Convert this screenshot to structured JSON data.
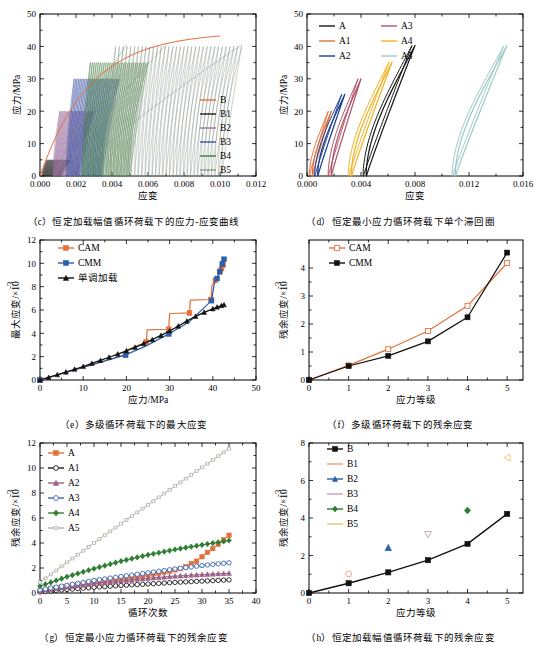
{
  "figure": {
    "panels": [
      "c",
      "d",
      "e",
      "f",
      "g",
      "h"
    ]
  },
  "panel_c": {
    "caption": "（c）恒定加载幅值循环荷载下的应力-应变曲线",
    "chart_data": {
      "type": "line",
      "title": "",
      "xlabel": "应变",
      "ylabel": "应力/MPa",
      "xlim": [
        0,
        0.012
      ],
      "ylim": [
        0,
        50
      ],
      "xticks": [
        "0.000",
        "0.002",
        "0.004",
        "0.006",
        "0.008",
        "0.010",
        "0.012"
      ],
      "yticks": [
        "0",
        "10",
        "20",
        "30",
        "40",
        "50"
      ],
      "grid": false,
      "legend_position": "right-middle",
      "series": [
        {
          "name": "B",
          "color": "#e2713c",
          "peak_stress": 43.2,
          "peak_strain": 0.01,
          "note": "单调包络线"
        },
        {
          "name": "B1",
          "color": "#1a1a1a",
          "cycle_stress": 5,
          "strain_range": [
            0.0004,
            0.0018
          ]
        },
        {
          "name": "B2",
          "color": "#9b6fa0",
          "cycle_stress": 20,
          "strain_range": [
            0.0011,
            0.003
          ]
        },
        {
          "name": "B3",
          "color": "#3a52a4",
          "cycle_stress": 30,
          "strain_range": [
            0.0019,
            0.0044
          ]
        },
        {
          "name": "B4",
          "color": "#3f7a3a",
          "cycle_stress": 35,
          "strain_range": [
            0.0028,
            0.006
          ]
        },
        {
          "name": "B5",
          "color": "#8a9a8c",
          "cycle_stress": 40,
          "strain_range": [
            0.0042,
            0.0112
          ]
        }
      ]
    }
  },
  "panel_d": {
    "caption": "（d）恒定最小应力循环荷载下单个滞回圈",
    "chart_data": {
      "type": "line",
      "title": "",
      "xlabel": "应变",
      "ylabel": "应力/MPa",
      "xlim": [
        0,
        0.016
      ],
      "ylim": [
        0,
        50
      ],
      "xticks": [
        "0.000",
        "0.004",
        "0.008",
        "0.012",
        "0.016"
      ],
      "yticks": [
        "0",
        "10",
        "20",
        "30",
        "40",
        "50"
      ],
      "grid": false,
      "legend_position": "top-left",
      "series": [
        {
          "name": "A",
          "color": "#1a1a1a",
          "loop_top_stress": 40.3,
          "loop_top_strain": 0.008,
          "loop_base_strain": 0.0044
        },
        {
          "name": "A1",
          "color": "#e2713c",
          "loop_top_stress": 20.0,
          "loop_top_strain": 0.0018,
          "loop_base_strain": 0.0004
        },
        {
          "name": "A2",
          "color": "#1b3f94",
          "loop_top_stress": 25.2,
          "loop_top_strain": 0.0028,
          "loop_base_strain": 0.0008
        },
        {
          "name": "A3",
          "color": "#b0566a",
          "loop_top_stress": 30.0,
          "loop_top_strain": 0.004,
          "loop_base_strain": 0.0018
        },
        {
          "name": "A4",
          "color": "#f0b323",
          "loop_top_stress": 35.2,
          "loop_top_strain": 0.0063,
          "loop_base_strain": 0.0033
        },
        {
          "name": "A5",
          "color": "#9fcbc6",
          "loop_top_stress": 40.2,
          "loop_top_strain": 0.0148,
          "loop_base_strain": 0.011
        }
      ]
    }
  },
  "panel_e": {
    "caption": "（e）多级循环荷载下的最大应变",
    "chart_data": {
      "type": "line",
      "title": "",
      "xlabel": "应力/MPa",
      "ylabel": "最大应变/×10⁻³",
      "xlim": [
        0,
        50
      ],
      "ylim": [
        0,
        12
      ],
      "xticks": [
        "0",
        "10",
        "20",
        "30",
        "40",
        "50"
      ],
      "yticks": [
        "0",
        "2",
        "4",
        "6",
        "8",
        "10",
        "12"
      ],
      "grid": false,
      "legend_position": "top-left",
      "series": [
        {
          "name": "CAM",
          "color": "#e2713c",
          "marker": "square-filled",
          "x": [
            0,
            19.8,
            20.0,
            24.6,
            24.8,
            29.8,
            30.0,
            34.6,
            34.8,
            39.6,
            39.8,
            40.6,
            41.0,
            41.6,
            42.0,
            42.4
          ],
          "y": [
            0,
            2.15,
            2.55,
            3.25,
            4.3,
            4.35,
            5.7,
            5.75,
            6.85,
            6.9,
            8.1,
            8.55,
            8.6,
            9.25,
            9.55,
            9.85
          ]
        },
        {
          "name": "CMM",
          "color": "#2b5fa8",
          "marker": "square-filled",
          "x": [
            0,
            19.8,
            24.7,
            29.8,
            34.6,
            39.7,
            40.4,
            41.0,
            41.6,
            42.2,
            42.6
          ],
          "y": [
            0,
            2.15,
            2.95,
            3.95,
            5.0,
            6.8,
            8.35,
            8.7,
            9.3,
            9.95,
            10.35
          ]
        },
        {
          "name": "单调加载",
          "color": "#111111",
          "marker": "triangle-filled",
          "x": [
            0,
            2,
            4,
            6,
            8,
            10,
            12,
            14,
            16,
            18,
            20,
            22,
            24,
            26,
            28,
            30,
            32,
            34,
            36,
            38,
            40,
            41,
            42,
            42.6
          ],
          "y": [
            0,
            0.22,
            0.45,
            0.68,
            0.92,
            1.16,
            1.42,
            1.68,
            1.95,
            2.22,
            2.5,
            2.8,
            3.12,
            3.46,
            3.82,
            4.2,
            4.62,
            5.05,
            5.45,
            5.8,
            6.1,
            6.25,
            6.38,
            6.45
          ]
        }
      ]
    }
  },
  "panel_f": {
    "caption": "（f）多级循环荷载下的残余应变",
    "chart_data": {
      "type": "line",
      "title": "",
      "xlabel": "应力等级",
      "ylabel": "残余应变/×10⁻³",
      "xlim": [
        0,
        5.4
      ],
      "ylim": [
        0,
        5
      ],
      "xticks": [
        "0",
        "1",
        "2",
        "3",
        "4",
        "5"
      ],
      "yticks": [
        "0",
        "1",
        "2",
        "3",
        "4"
      ],
      "grid": false,
      "legend_position": "top-left",
      "categories": [
        0,
        1,
        2,
        3,
        4,
        5
      ],
      "series": [
        {
          "name": "CAM",
          "color": "#e2713c",
          "marker": "square-open",
          "values": [
            0,
            0.52,
            1.1,
            1.75,
            2.65,
            4.18
          ]
        },
        {
          "name": "CMM",
          "color": "#111111",
          "marker": "square-filled",
          "values": [
            0,
            0.5,
            0.86,
            1.38,
            2.24,
            4.55
          ]
        }
      ]
    }
  },
  "panel_g": {
    "caption": "（g）恒定最小应力循环荷载下的残余应变",
    "chart_data": {
      "type": "line",
      "title": "",
      "xlabel": "循环次数",
      "ylabel": "残余应变/×10⁻³",
      "xlim": [
        0,
        40
      ],
      "ylim": [
        0,
        12
      ],
      "xticks": [
        "0",
        "5",
        "10",
        "15",
        "20",
        "25",
        "30",
        "35",
        "40"
      ],
      "yticks": [
        "0",
        "2",
        "4",
        "6",
        "8",
        "10",
        "12"
      ],
      "grid": false,
      "legend_position": "top-left",
      "series": [
        {
          "name": "A",
          "color": "#e2713c",
          "marker": "square-filled",
          "end_cycle": 35,
          "end_value": 4.62,
          "x": [
            0,
            2,
            5,
            8,
            11,
            14,
            17,
            20,
            22,
            24,
            26,
            27,
            28,
            29,
            30,
            31,
            32,
            33,
            34,
            35
          ],
          "y": [
            0.15,
            0.35,
            0.55,
            0.75,
            0.95,
            1.1,
            1.25,
            1.45,
            1.6,
            1.75,
            1.95,
            2.1,
            2.35,
            2.55,
            2.9,
            3.25,
            3.55,
            3.9,
            4.25,
            4.62
          ]
        },
        {
          "name": "A1",
          "color": "#1a1a1a",
          "marker": "circle-open",
          "end_cycle": 35,
          "end_value": 1.05,
          "x": [
            0,
            5,
            10,
            15,
            20,
            25,
            30,
            35
          ],
          "y": [
            0.08,
            0.28,
            0.45,
            0.6,
            0.72,
            0.85,
            0.95,
            1.05
          ]
        },
        {
          "name": "A2",
          "color": "#9b5f86",
          "marker": "triangle-filled",
          "end_cycle": 35,
          "end_value": 1.58,
          "x": [
            0,
            5,
            10,
            15,
            20,
            25,
            30,
            35
          ],
          "y": [
            0.18,
            0.48,
            0.75,
            0.98,
            1.18,
            1.35,
            1.48,
            1.58
          ]
        },
        {
          "name": "A3",
          "color": "#3a66b5",
          "marker": "circle-open",
          "end_cycle": 35,
          "end_value": 2.42,
          "x": [
            0,
            5,
            10,
            15,
            20,
            25,
            30,
            35
          ],
          "y": [
            0.25,
            0.62,
            1.0,
            1.32,
            1.62,
            1.92,
            2.2,
            2.42
          ]
        },
        {
          "name": "A4",
          "color": "#2e7d32",
          "marker": "diamond-filled",
          "end_cycle": 35,
          "end_value": 4.2,
          "x": [
            0,
            5,
            10,
            15,
            20,
            25,
            30,
            35
          ],
          "y": [
            0.55,
            1.3,
            1.95,
            2.55,
            3.05,
            3.48,
            3.85,
            4.2
          ]
        },
        {
          "name": "A5",
          "color": "#b9b3ae",
          "marker": "bar-open",
          "end_cycle": 35,
          "end_value": 11.55,
          "x": [
            0,
            5,
            10,
            15,
            20,
            25,
            30,
            35
          ],
          "y": [
            0.85,
            2.45,
            4.0,
            5.55,
            7.05,
            8.55,
            10.05,
            11.55
          ]
        }
      ]
    }
  },
  "panel_h": {
    "caption": "（h）恒定加载幅值循环荷载下的残余应变",
    "chart_data": {
      "type": "scatter",
      "title": "",
      "xlabel": "应力等级",
      "ylabel": "残余应变/×10⁻³",
      "xlim": [
        0,
        5.4
      ],
      "ylim": [
        0,
        8
      ],
      "xticks": [
        "0",
        "1",
        "2",
        "3",
        "4",
        "5"
      ],
      "yticks": [
        "0",
        "2",
        "4",
        "6",
        "8"
      ],
      "grid": false,
      "legend_position": "top-left",
      "series": [
        {
          "name": "B",
          "color": "#111111",
          "marker": "square-filled",
          "type": "line",
          "x": [
            0,
            1,
            2,
            3,
            4,
            5
          ],
          "y": [
            0,
            0.52,
            1.1,
            1.75,
            2.62,
            4.22
          ]
        },
        {
          "name": "B1",
          "color": "#e8a07a",
          "marker": "circle-open",
          "type": "point",
          "x": [
            1
          ],
          "y": [
            1.02
          ]
        },
        {
          "name": "B2",
          "color": "#2b5fa8",
          "marker": "triangle-filled",
          "type": "point",
          "x": [
            2
          ],
          "y": [
            2.42
          ]
        },
        {
          "name": "B3",
          "color": "#c9a0b8",
          "marker": "triangle-down-open",
          "type": "point",
          "x": [
            3
          ],
          "y": [
            3.12
          ]
        },
        {
          "name": "B4",
          "color": "#2e7d32",
          "marker": "diamond-filled",
          "type": "point",
          "x": [
            4
          ],
          "y": [
            4.4
          ]
        },
        {
          "name": "B5",
          "color": "#f0c070",
          "marker": "triangle-left-open",
          "type": "point",
          "x": [
            5
          ],
          "y": [
            7.22
          ]
        }
      ]
    }
  }
}
